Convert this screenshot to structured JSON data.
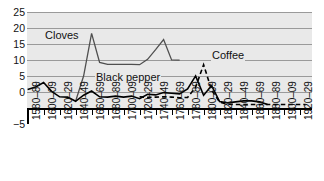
{
  "chart_data": {
    "type": "line",
    "title": "",
    "xlabel": "",
    "ylabel": "",
    "ylim": [
      -5,
      25
    ],
    "grid": true,
    "legend_position": "inline-labels",
    "y_ticks": [
      "25",
      "20",
      "15",
      "10",
      "5",
      "0",
      "−5"
    ],
    "categories": [
      "1580–89",
      "1590–99",
      "1600–09",
      "1610–19",
      "1620–29",
      "1630–39",
      "1640–49",
      "1650–59",
      "1660–69",
      "1670–79",
      "1680–89",
      "1690–99",
      "1700–09",
      "1710–19",
      "1720–29",
      "1730–39",
      "1740–49",
      "1750–59",
      "1760–69",
      "1770–79",
      "1780–89",
      "1790–99",
      "1800–09",
      "1810–19",
      "1820–29",
      "1830–39",
      "1840–49",
      "1850–59",
      "1860–69",
      "1870–79",
      "1880–89",
      "1890–99",
      "1900–09",
      "1910–19",
      "1920–29"
    ],
    "x_tick_labels": [
      "1580–89",
      "1600–09",
      "1620–29",
      "1640–49",
      "1660–69",
      "1680–89",
      "1700–09",
      "1720–29",
      "1740–49",
      "1760–69",
      "1780–89",
      "1800–09",
      "1820–29",
      "1840–49",
      "1860–69",
      "1880–89",
      "1900–09",
      "1920–29"
    ],
    "series": [
      {
        "name": "Cloves",
        "style": "solid-gray",
        "color": "#4f4f4f",
        "x": [
          "1640–49",
          "1650–59",
          "1660–69",
          "1670–79",
          "1680–89",
          "1690–99",
          "1700–09",
          "1710–19",
          "1720–29",
          "1730–39",
          "1740–49",
          "1750–59",
          "1760–69",
          "1770–79"
        ],
        "values": [
          2.0,
          10.0,
          23.2,
          14.0,
          13.4,
          13.4,
          13.4,
          13.4,
          13.3,
          15.0,
          18.0,
          21.2,
          14.8,
          14.7
        ]
      },
      {
        "name": "Black pepper",
        "style": "solid-black",
        "color": "#000000",
        "x": [
          "1580–89",
          "1590–99",
          "1600–09",
          "1610–19",
          "1620–29",
          "1630–39",
          "1640–49",
          "1650–59",
          "1660–69",
          "1670–79",
          "1680–89",
          "1690–99",
          "1700–09",
          "1710–19",
          "1720–29",
          "1730–39",
          "1740–49",
          "1750–59",
          "1760–69",
          "1770–79",
          "1780–89",
          "1790–99",
          "1800–09",
          "1810–19",
          "1820–29",
          "1830–39",
          "1840–49",
          "1850–59",
          "1860–69",
          "1870–79",
          "1880–89"
        ],
        "values": [
          5.8,
          6.6,
          8.0,
          5.2,
          3.5,
          3.4,
          2.1,
          4.0,
          5.3,
          3.5,
          3.4,
          3.7,
          3.4,
          3.7,
          2.9,
          4.3,
          4.1,
          4.8,
          4.6,
          4.4,
          6.0,
          10.0,
          4.0,
          7.0,
          2.0,
          1.6,
          1.9,
          2.2,
          2.2,
          1.9,
          1.1
        ]
      },
      {
        "name": "Coffee",
        "style": "dashed-black",
        "color": "#000000",
        "x": [
          "1720–29",
          "1730–39",
          "1740–49",
          "1750–59",
          "1760–69",
          "1770–79",
          "1780–89",
          "1790–99",
          "1800–09",
          "1810–19",
          "1820–29",
          "1830–39",
          "1840–49",
          "1850–59",
          "1860–69",
          "1870–79",
          "1880–89",
          "1890–99",
          "1900–09",
          "1910–19",
          "1920–29"
        ],
        "values": [
          3.5,
          3.3,
          3.4,
          3.5,
          3.4,
          3.2,
          3.3,
          6.5,
          13.5,
          5.6,
          1.8,
          1.2,
          1.1,
          1.1,
          1.1,
          1.1,
          1.1,
          1.1,
          1.1,
          1.1,
          1.1
        ]
      }
    ],
    "annotations": [
      {
        "text": "Cloves",
        "series": "Cloves"
      },
      {
        "text": "Black pepper",
        "series": "Black pepper"
      },
      {
        "text": "Coffee",
        "series": "Coffee"
      }
    ]
  }
}
